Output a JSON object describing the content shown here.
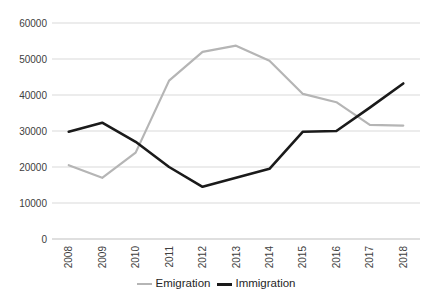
{
  "chart_data": {
    "type": "line",
    "title": "",
    "xlabel": "",
    "ylabel": "",
    "categories": [
      "2008",
      "2009",
      "2010",
      "2011",
      "2012",
      "2013",
      "2014",
      "2015",
      "2016",
      "2017",
      "2018"
    ],
    "series": [
      {
        "name": "Emigration",
        "color": "#b5b5b5",
        "stroke_width": 2.2,
        "values": [
          20500,
          17000,
          24000,
          44000,
          52000,
          53700,
          49500,
          40300,
          38000,
          31700,
          31500
        ]
      },
      {
        "name": "Immigration",
        "color": "#1a1a1a",
        "stroke_width": 2.6,
        "values": [
          29800,
          32300,
          27000,
          20000,
          14500,
          17000,
          19500,
          29800,
          30000,
          36500,
          43200
        ]
      }
    ],
    "ylim": [
      0,
      60000
    ],
    "y_ticks": [
      0,
      10000,
      20000,
      30000,
      40000,
      50000,
      60000
    ],
    "grid": "horizontal",
    "grid_color": "#d9d9d9",
    "axis_color": "#bfbfbf",
    "tick_label_color": "#404040",
    "legend_position": "bottom"
  }
}
